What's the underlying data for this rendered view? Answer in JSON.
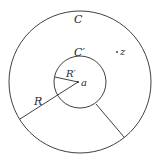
{
  "diagram": {
    "type": "concentric-circles-annulus",
    "outer_circle": {
      "label": "C",
      "radius_label": "R",
      "cx": 80,
      "cy": 82,
      "r": 71
    },
    "inner_circle": {
      "label": "C′",
      "radius_label": "R′",
      "cx": 80,
      "cy": 82,
      "r": 26
    },
    "center_point": {
      "label": "a"
    },
    "point": {
      "label": "z"
    },
    "colors": {
      "stroke": "#2a2a2a",
      "background": "#ffffff"
    }
  }
}
